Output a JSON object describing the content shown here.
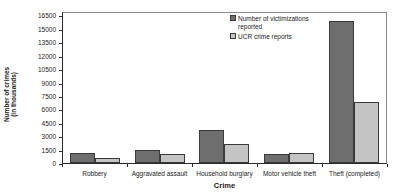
{
  "chart_data": {
    "type": "bar",
    "title": "",
    "xlabel": "Crime",
    "ylabel_line1": "Number of crimes",
    "ylabel_line2": "(in thousands)",
    "categories": [
      "Robbery",
      "Aggravated assault",
      "Household burglary",
      "Motor vehicle theft",
      "Theft (completed)"
    ],
    "series": [
      {
        "name": "Number of victimizations reported",
        "color": "#6e6e6e",
        "values": [
          1100,
          1500,
          3700,
          1050,
          16000
        ]
      },
      {
        "name": "UCR crime reports",
        "color": "#c4c4c4",
        "values": [
          600,
          1000,
          2100,
          1150,
          6900
        ]
      }
    ],
    "ylim": [
      0,
      17000
    ],
    "yticks": [
      0,
      1500,
      3000,
      4500,
      6000,
      7500,
      9000,
      10500,
      12000,
      13500,
      15000,
      16500
    ],
    "ytick_labels": [
      "0",
      "1500",
      "3000",
      "4500",
      "6000",
      "7500",
      "9000",
      "10500",
      "12000",
      "13500",
      "15000",
      "16500"
    ],
    "grid": false,
    "legend_position": "top-right"
  },
  "legend": {
    "items": [
      {
        "label": "Number of victimizations reported",
        "swatch": "#6e6e6e"
      },
      {
        "label": "UCR crime reports",
        "swatch": "#c4c4c4"
      }
    ]
  }
}
